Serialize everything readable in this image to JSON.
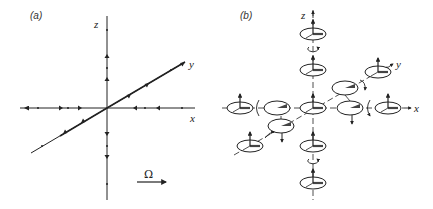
{
  "figure": {
    "panel_a": {
      "label": "(a)",
      "axes": {
        "x": "x",
        "y": "y",
        "z": "z"
      },
      "omega_label": "Ω",
      "description": "Cartesian axes with flow arrows pointing outward from origin along x, y and z"
    },
    "panel_b": {
      "label": "(b)",
      "axes": {
        "x": "x",
        "y": "y",
        "z": "z"
      },
      "description": "Spinning discs with vertical spin vectors placed along each axis, with rotation arrows between them"
    },
    "colors": {
      "line": "#222222",
      "background": "#ffffff"
    }
  }
}
